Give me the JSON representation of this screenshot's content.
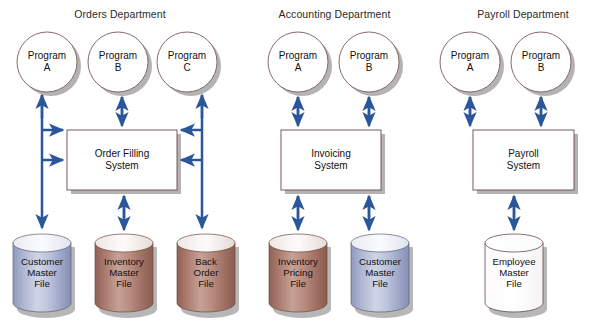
{
  "diagram": {
    "title_bar": null,
    "background_color": "#ffffff",
    "arrow_color": "#2b5699",
    "box_border_color": "#6b4a4a",
    "circle_border_color": "#7a5a58",
    "shadow_color": "#9a9a9a"
  },
  "departments": [
    {
      "id": "orders",
      "title": "Orders Department",
      "programs": [
        {
          "id": "orders-program-a",
          "label": "Program\nA"
        },
        {
          "id": "orders-program-b",
          "label": "Program\nB"
        },
        {
          "id": "orders-program-c",
          "label": "Program\nC"
        }
      ],
      "system": {
        "id": "order-filling-system",
        "label": "Order Filling\nSystem"
      },
      "files": [
        {
          "id": "customer-master-file",
          "label": "Customer\nMaster\nFile",
          "color": "blue"
        },
        {
          "id": "inventory-master-file",
          "label": "Inventory\nMaster\nFile",
          "color": "brown"
        },
        {
          "id": "back-order-file",
          "label": "Back\nOrder\nFile",
          "color": "brown"
        }
      ]
    },
    {
      "id": "accounting",
      "title": "Accounting Department",
      "programs": [
        {
          "id": "accounting-program-a",
          "label": "Program\nA"
        },
        {
          "id": "accounting-program-b",
          "label": "Program\nB"
        }
      ],
      "system": {
        "id": "invoicing-system",
        "label": "Invoicing\nSystem"
      },
      "files": [
        {
          "id": "inventory-pricing-file",
          "label": "Inventory\nPricing\nFile",
          "color": "brown"
        },
        {
          "id": "accounting-customer-master-file",
          "label": "Customer\nMaster\nFile",
          "color": "blue"
        }
      ]
    },
    {
      "id": "payroll",
      "title": "Payroll Department",
      "programs": [
        {
          "id": "payroll-program-a",
          "label": "Program\nA"
        },
        {
          "id": "payroll-program-b",
          "label": "Program\nB"
        }
      ],
      "system": {
        "id": "payroll-system",
        "label": "Payroll\nSystem"
      },
      "files": [
        {
          "id": "employee-master-file",
          "label": "Employee\nMaster\nFile",
          "color": "white"
        }
      ]
    }
  ]
}
